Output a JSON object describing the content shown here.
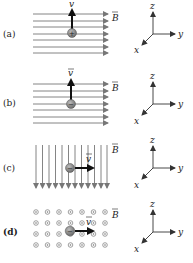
{
  "panels": [
    {
      "label": "(a)",
      "field": {
        "type": "horizontal-lines",
        "direction": "+y",
        "count": 7,
        "label": "B"
      },
      "particle": {
        "charge": "+",
        "velocity": {
          "direction": "+z",
          "label": "v"
        }
      },
      "axes": {
        "z": "z",
        "y": "y",
        "x": "x"
      }
    },
    {
      "label": "(b)",
      "field": {
        "type": "horizontal-lines",
        "direction": "+y",
        "count": 7,
        "label": "B"
      },
      "particle": {
        "charge": "−",
        "velocity": {
          "direction": "+z",
          "label": "v"
        }
      },
      "axes": {
        "z": "z",
        "y": "y",
        "x": "x"
      }
    },
    {
      "label": "(c)",
      "field": {
        "type": "vertical-lines",
        "direction": "-z",
        "count": 12,
        "label": "B"
      },
      "particle": {
        "charge": "−",
        "velocity": {
          "direction": "+y",
          "label": "v"
        }
      },
      "axes": {
        "z": "z",
        "y": "y",
        "x": "x"
      }
    },
    {
      "label": "(d)",
      "field": {
        "type": "dots-out-of-page",
        "direction": "+x",
        "rows": 4,
        "cols": 7,
        "label": "B"
      },
      "particle": {
        "charge": "−",
        "velocity": {
          "direction": "+y",
          "label": "v"
        }
      },
      "axes": {
        "z": "z",
        "y": "y",
        "x": "x"
      }
    }
  ],
  "colors": {
    "field_line": "#777777",
    "vector": "#111111",
    "particle": "#8a8a8a",
    "axis": "#444444"
  }
}
